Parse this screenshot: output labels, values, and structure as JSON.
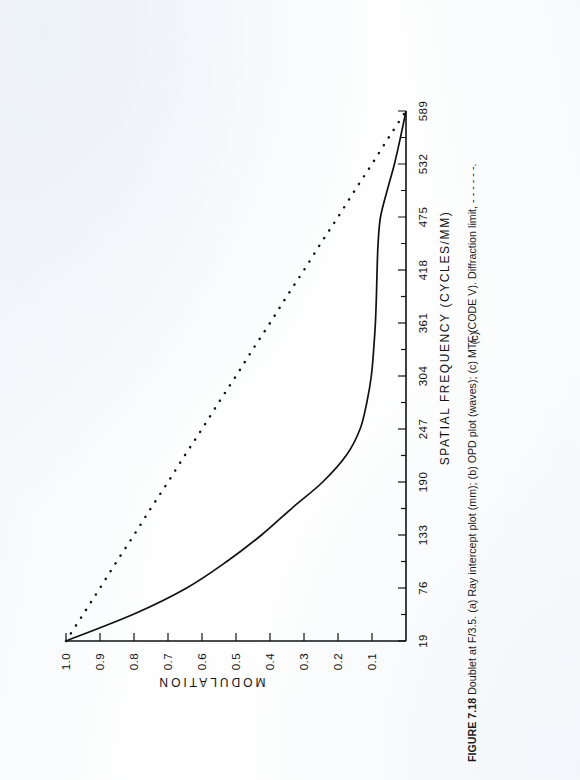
{
  "page": {
    "orientation": "landscape-figure-rotated-90",
    "background": "#fefefe",
    "ink": "#111111"
  },
  "caption": {
    "figure_number": "FIGURE 7.18",
    "text": "   Doublet at F/3.5. (a) Ray intercept plot (mm); (b) OPD plot (waves); (c) MTF (CODE V). Diffraction limit, - - - - - -."
  },
  "panel": {
    "label": "(c)"
  },
  "chart_data": {
    "type": "line",
    "title": "",
    "subtitle": "",
    "xlabel": "SPATIAL FREQUENCY  (CYCLES/MM)",
    "ylabel": "MODULATION",
    "xlim": [
      19,
      589
    ],
    "ylim": [
      0,
      1.0
    ],
    "grid": false,
    "legend_position": "none",
    "xticks": [
      19,
      76,
      133,
      190,
      247,
      304,
      361,
      418,
      475,
      532,
      589
    ],
    "xtick_labels": [
      "19",
      "76",
      "133",
      "190",
      "247",
      "304",
      "361",
      "418",
      "475",
      "532",
      "589"
    ],
    "yticks": [
      0.1,
      0.2,
      0.3,
      0.4,
      0.5,
      0.6,
      0.7,
      0.8,
      0.9,
      1.0
    ],
    "ytick_labels": [
      "0.1",
      "0.2",
      "0.3",
      "0.4",
      "0.5",
      "0.6",
      "0.7",
      "0.8",
      "0.9",
      "1.0"
    ],
    "minor_tick_interval": 28.5,
    "x": [
      19,
      48,
      76,
      105,
      133,
      162,
      190,
      219,
      247,
      276,
      304,
      333,
      361,
      390,
      418,
      447,
      475,
      504,
      532,
      561,
      589
    ],
    "series": [
      {
        "name": "MTF (CODE V)",
        "style": "solid",
        "color": "#111111",
        "values": [
          1.0,
          0.8,
          0.645,
          0.525,
          0.425,
          0.335,
          0.245,
          0.175,
          0.135,
          0.115,
          0.102,
          0.095,
          0.09,
          0.087,
          0.085,
          0.082,
          0.075,
          0.055,
          0.034,
          0.016,
          0.0
        ]
      },
      {
        "name": "Diffraction limit",
        "style": "dotted",
        "color": "#111111",
        "values": [
          1.0,
          0.949,
          0.9,
          0.85,
          0.8,
          0.75,
          0.7,
          0.65,
          0.6,
          0.55,
          0.5,
          0.45,
          0.4,
          0.35,
          0.3,
          0.25,
          0.2,
          0.15,
          0.1,
          0.05,
          0.0
        ]
      }
    ],
    "annotations": []
  }
}
